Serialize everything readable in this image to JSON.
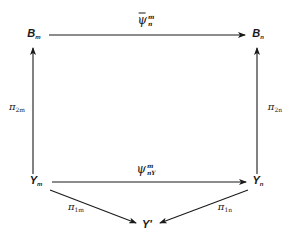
{
  "diagram": {
    "type": "commutative-diagram",
    "nodes": {
      "B_m": {
        "base": "B",
        "sub": "m"
      },
      "B_n": {
        "base": "B",
        "sub": "n"
      },
      "Y_m": {
        "base": "Y",
        "sub": "m"
      },
      "Y_n": {
        "base": "Y",
        "sub": "n"
      },
      "Y_prime": {
        "base": "Y'"
      }
    },
    "arrows": {
      "top": {
        "from": "B_m",
        "to": "B_n",
        "label_base": "ψ",
        "label_sup": "m",
        "label_sub": "n",
        "overbar": true
      },
      "middle": {
        "from": "Y_m",
        "to": "Y_n",
        "label_base": "ψ",
        "label_sup": "m",
        "label_sub": "nY",
        "overbar": false
      },
      "left_vertical": {
        "from": "Y_m",
        "to": "B_m",
        "label_base": "π",
        "label_sub": "2m"
      },
      "right_vertical": {
        "from": "Y_n",
        "to": "B_n",
        "label_base": "π",
        "label_sub": "2n"
      },
      "left_diagonal": {
        "from": "Y_m",
        "to": "Y_prime",
        "label_base": "π",
        "label_sub": "1m"
      },
      "right_diagonal": {
        "from": "Y_n",
        "to": "Y_prime",
        "label_base": "π",
        "label_sub": "1n"
      }
    }
  }
}
